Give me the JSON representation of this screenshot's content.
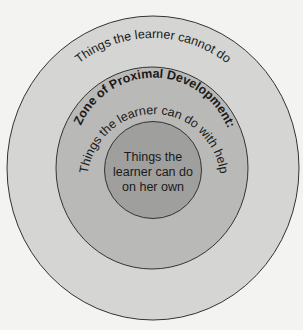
{
  "diagram": {
    "title": "Zone of Proximal Development",
    "outer_ring": {
      "label": "Things the learner cannot do",
      "color": "#d5d5d3"
    },
    "middle_ring": {
      "title": "Zone of Proximal Development:",
      "label": "Things the learner can do with help",
      "color": "#b9b9b7"
    },
    "inner_circle": {
      "lines": [
        "Things the",
        "learner can do",
        "on her own"
      ],
      "color": "#9f9f9d"
    },
    "background_color": "#f3f3f1",
    "stroke_color": "#333333"
  }
}
